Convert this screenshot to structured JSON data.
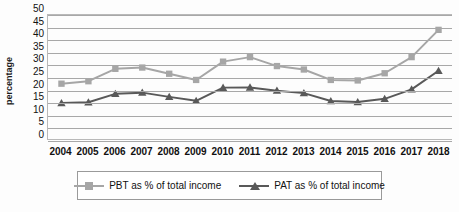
{
  "chart_data": {
    "type": "line",
    "title": "",
    "xlabel": "",
    "ylabel": "percentage",
    "ylim": [
      0,
      50
    ],
    "ytick_step": 5,
    "grid": true,
    "legend_position": "bottom",
    "categories": [
      "2004",
      "2005",
      "2006",
      "2007",
      "2008",
      "2009",
      "2010",
      "2011",
      "2012",
      "2013",
      "2014",
      "2015",
      "2016",
      "2017",
      "2018"
    ],
    "yticks": [
      "0",
      "5",
      "10",
      "15",
      "20",
      "25",
      "30",
      "35",
      "40",
      "45",
      "50"
    ],
    "series": [
      {
        "name": "PBT as % of total income",
        "color": "#a6a6a6",
        "marker": "square",
        "values": [
          22.3,
          23.3,
          28.3,
          28.8,
          26.3,
          23.8,
          31.2,
          33.0,
          29.4,
          28.0,
          23.8,
          23.6,
          26.5,
          33.0,
          44.0
        ]
      },
      {
        "name": "PAT as % of total income",
        "color": "#595959",
        "marker": "triangle",
        "values": [
          14.5,
          14.8,
          18.2,
          18.7,
          17.0,
          15.4,
          20.7,
          20.8,
          19.5,
          18.5,
          15.3,
          14.9,
          16.2,
          20.0,
          27.5
        ]
      }
    ]
  },
  "legend": {
    "items": [
      {
        "label": "PBT as % of total income"
      },
      {
        "label": "PAT as % of total income"
      }
    ]
  }
}
